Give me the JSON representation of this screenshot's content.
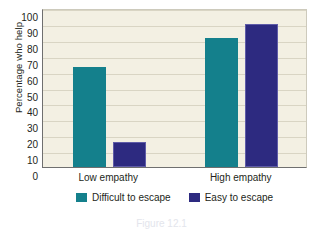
{
  "chart_data": {
    "type": "bar",
    "title": "",
    "xlabel": "",
    "ylabel": "Percentage who help",
    "categories": [
      "Low empathy",
      "High empathy"
    ],
    "series": [
      {
        "name": "Difficult to escape",
        "color": "#14808c",
        "values": [
          63,
          81
        ]
      },
      {
        "name": "Easy to escape",
        "color": "#2d2a80",
        "values": [
          16,
          90
        ]
      }
    ],
    "ylim": [
      0,
      100
    ],
    "ytick_step": 10,
    "yticks": [
      "100",
      "90",
      "80",
      "70",
      "60",
      "50",
      "40",
      "30",
      "20",
      "10",
      "0"
    ],
    "grid": true,
    "legend_position": "bottom"
  },
  "caption": {
    "fragment": "Figure 12.1"
  },
  "colors": {
    "teal": "#14808c",
    "purple": "#2d2a80",
    "plot_background": "#f3f0e3",
    "gridline": "#d9d5c4",
    "axis": "#6f6f6f",
    "text": "#231f20"
  }
}
